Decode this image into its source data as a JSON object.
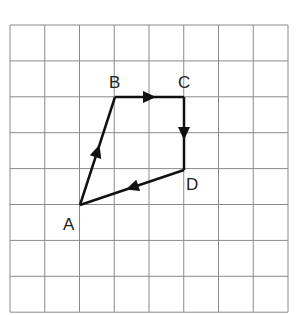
{
  "grid": {
    "cols": 8,
    "rows": 8,
    "left": 10,
    "top": 25,
    "cell_w": 34.75,
    "cell_h": 35.9,
    "line_color": "#8a8a8a"
  },
  "points": {
    "A": {
      "label": "A",
      "x": 80,
      "y": 205
    },
    "B": {
      "label": "B",
      "x": 115,
      "y": 97
    },
    "C": {
      "label": "C",
      "x": 184,
      "y": 97
    },
    "D": {
      "label": "D",
      "x": 184,
      "y": 170
    }
  },
  "vectors": [
    {
      "from": "A",
      "to": "B"
    },
    {
      "from": "B",
      "to": "C"
    },
    {
      "from": "C",
      "to": "D"
    },
    {
      "from": "D",
      "to": "A"
    }
  ],
  "labels": {
    "A": "A",
    "B": "B",
    "C": "C",
    "D": "D"
  }
}
